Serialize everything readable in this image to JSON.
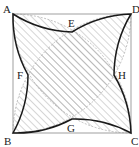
{
  "diagram": {
    "type": "geometry",
    "vertices": {
      "A": {
        "label": "A",
        "x": 13,
        "y": 14
      },
      "B": {
        "label": "B",
        "x": 13,
        "y": 133
      },
      "C": {
        "label": "C",
        "x": 131,
        "y": 133
      },
      "D": {
        "label": "D",
        "x": 131,
        "y": 14
      }
    },
    "cusps": {
      "E": {
        "label": "E"
      },
      "F": {
        "label": "F"
      },
      "G": {
        "label": "G"
      },
      "H": {
        "label": "H"
      }
    },
    "colors": {
      "square": "#888888",
      "boundary": "#1a1a1a",
      "hatch": "#8a8a8a",
      "dashed": "#999999"
    }
  }
}
